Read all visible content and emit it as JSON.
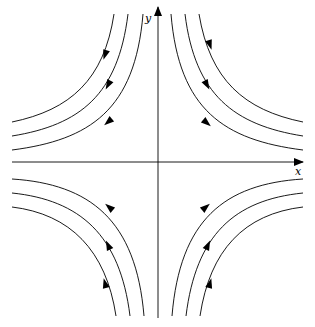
{
  "diagram": {
    "type": "phase-portrait",
    "axes": {
      "x_label": "x",
      "y_label": "y",
      "origin": [
        158,
        162
      ],
      "x_axis": {
        "from": [
          12,
          162
        ],
        "to": [
          303,
          162
        ]
      },
      "y_axis": {
        "from": [
          158,
          318
        ],
        "to": [
          158,
          7
        ]
      }
    },
    "colors": {
      "stroke": "#000000",
      "background": "#ffffff"
    },
    "trajectories": [
      {
        "id": "ul-1",
        "quadrant": "upper-left",
        "path": "M114,14 C104,80 70,110 12,122",
        "arrow": {
          "x": 105,
          "y": 55,
          "angle": 108
        }
      },
      {
        "id": "ul-2",
        "quadrant": "upper-left",
        "path": "M128,14 C118,95 80,125 12,136",
        "arrow": {
          "x": 108,
          "y": 85,
          "angle": 118
        }
      },
      {
        "id": "ul-3",
        "quadrant": "upper-left",
        "path": "M143,14 C135,110 90,140 12,150",
        "arrow": {
          "x": 108,
          "y": 122,
          "angle": 140
        }
      },
      {
        "id": "ur-1",
        "quadrant": "upper-right",
        "path": "M199,14 C210,80 244,110 303,122",
        "arrow": {
          "x": 210,
          "y": 45,
          "angle": 72
        }
      },
      {
        "id": "ur-2",
        "quadrant": "upper-right",
        "path": "M185,14 C195,95 234,125 303,136",
        "arrow": {
          "x": 207,
          "y": 85,
          "angle": 62
        }
      },
      {
        "id": "ur-3",
        "quadrant": "upper-right",
        "path": "M171,14 C179,110 224,140 303,150",
        "arrow": {
          "x": 207,
          "y": 123,
          "angle": 40
        }
      },
      {
        "id": "ll-1",
        "quadrant": "lower-left",
        "path": "M144,316 C136,220 90,184 12,179",
        "arrow": {
          "x": 109,
          "y": 207,
          "angle": 220
        }
      },
      {
        "id": "ll-2",
        "quadrant": "lower-left",
        "path": "M130,316 C120,235 80,200 12,193",
        "arrow": {
          "x": 108,
          "y": 245,
          "angle": 245
        }
      },
      {
        "id": "ll-3",
        "quadrant": "lower-left",
        "path": "M116,316 C106,250 70,214 12,207",
        "arrow": {
          "x": 105,
          "y": 283,
          "angle": 255
        }
      },
      {
        "id": "lr-1",
        "quadrant": "lower-right",
        "path": "M172,316 C180,220 224,184 303,179",
        "arrow": {
          "x": 206,
          "y": 207,
          "angle": 320
        }
      },
      {
        "id": "lr-2",
        "quadrant": "lower-right",
        "path": "M186,316 C196,235 234,200 303,193",
        "arrow": {
          "x": 208,
          "y": 245,
          "angle": 295
        }
      },
      {
        "id": "lr-3",
        "quadrant": "lower-right",
        "path": "M200,316 C210,250 244,214 303,207",
        "arrow": {
          "x": 210,
          "y": 283,
          "angle": 285
        }
      }
    ]
  }
}
